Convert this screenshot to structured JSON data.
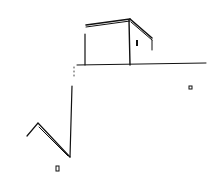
{
  "drawing": {
    "description": "Pen sketch of a box-shaped building on a horizon line, with a zigzag line and small squares",
    "stroke_color": "#111111",
    "background": "#ffffff"
  }
}
